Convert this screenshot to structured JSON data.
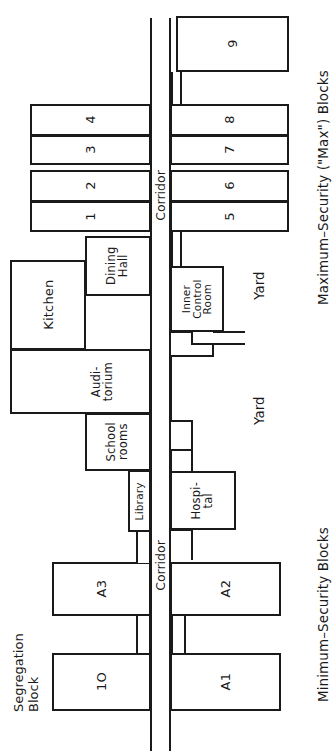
{
  "diagram": {
    "orientation": "rotated-90",
    "stroke_color": "#1a1a1a",
    "fill_color": "#ffffff"
  },
  "captions": {
    "max_security": "Maximum–Security (\"Max\") Blocks",
    "min_security": "Minimum–Security  Blocks",
    "segregation": "Segregation\nBlock",
    "segregation_line1": "Segregation",
    "segregation_line2": "Block"
  },
  "corridor": {
    "label_upper": "Corridor",
    "label_lower": "Corridor"
  },
  "max_blocks": {
    "left": [
      {
        "id": "b4",
        "label": "4"
      },
      {
        "id": "b3",
        "label": "3"
      },
      {
        "id": "b2",
        "label": "2"
      },
      {
        "id": "b1",
        "label": "1"
      }
    ],
    "right": [
      {
        "id": "b9",
        "label": "9"
      },
      {
        "id": "b8",
        "label": "8"
      },
      {
        "id": "b7",
        "label": "7"
      },
      {
        "id": "b6",
        "label": "6"
      },
      {
        "id": "b5",
        "label": "5"
      }
    ]
  },
  "service_rooms": [
    {
      "id": "dining-hall",
      "label": "Dining\nHall",
      "line1": "Dining",
      "line2": "Hall"
    },
    {
      "id": "kitchen",
      "label": "Kitchen"
    },
    {
      "id": "auditorium",
      "label": "Audi-\ntorium",
      "line1": "Audi-",
      "line2": "torium"
    },
    {
      "id": "school-rooms",
      "label": "School\nrooms",
      "line1": "School",
      "line2": "rooms"
    },
    {
      "id": "library",
      "label": "Library"
    },
    {
      "id": "inner-control-room",
      "label": "Inner\nControl\nRoom",
      "line1": "Inner",
      "line2": "Control",
      "line3": "Room"
    },
    {
      "id": "hospital",
      "label": "Hospi-\ntal",
      "line1": "Hospi-",
      "line2": "tal"
    }
  ],
  "yards": [
    {
      "id": "yard-upper",
      "label": "Yard"
    },
    {
      "id": "yard-lower",
      "label": "Yard"
    }
  ],
  "min_blocks": [
    {
      "id": "a3",
      "label": "A3"
    },
    {
      "id": "a2",
      "label": "A2"
    },
    {
      "id": "block10",
      "label": "1O"
    },
    {
      "id": "a1",
      "label": "A1"
    }
  ]
}
